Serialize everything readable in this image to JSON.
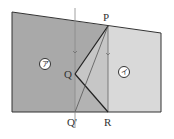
{
  "figure": {
    "points": {
      "P": {
        "label": "P",
        "x": 108,
        "y": 26
      },
      "Q": {
        "label": "Q",
        "x": 75,
        "y": 74
      },
      "Q_prime": {
        "label": "Q'",
        "x": 75,
        "y": 112
      },
      "R": {
        "label": "R",
        "x": 108,
        "y": 112
      }
    },
    "regions": {
      "a": {
        "label": "ア"
      },
      "i": {
        "label": "イ"
      }
    },
    "colors": {
      "dark_region": "#a9a9a9",
      "light_region": "#d9d9d9",
      "mid_triangle": "#c6c6c6",
      "low_triangle": "#b3b3b3",
      "stroke": "#333333",
      "fold_line": "#888888"
    }
  }
}
